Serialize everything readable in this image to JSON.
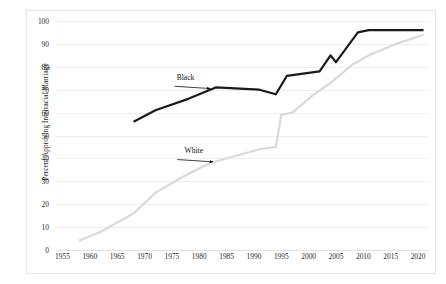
{
  "chart_data": {
    "type": "line",
    "title": "",
    "subtitle": "",
    "xlabel": "",
    "ylabel": "Percent Approving Interracial Marriage",
    "xlim": [
      1954,
      2022
    ],
    "ylim": [
      0,
      100
    ],
    "grid": true,
    "grid_axis": "y",
    "legend": "none",
    "x_ticks": [
      1955,
      1960,
      1965,
      1970,
      1975,
      1980,
      1985,
      1990,
      1995,
      2000,
      2005,
      2010,
      2015,
      2020
    ],
    "y_ticks": [
      0,
      10,
      20,
      30,
      40,
      50,
      60,
      70,
      80,
      90,
      100
    ],
    "series": [
      {
        "name": "Black",
        "color": "#1a1a1a",
        "width": 2.2,
        "points": [
          [
            1968,
            56
          ],
          [
            1972,
            61
          ],
          [
            1978,
            66
          ],
          [
            1983,
            71
          ],
          [
            1991,
            70
          ],
          [
            1994,
            68
          ],
          [
            1996,
            76
          ],
          [
            1999,
            77
          ],
          [
            2002,
            78
          ],
          [
            2004,
            85
          ],
          [
            2005,
            82
          ],
          [
            2009,
            95
          ],
          [
            2011,
            96
          ],
          [
            2021,
            96
          ]
        ]
      },
      {
        "name": "White",
        "color": "#d9d9d9",
        "width": 2.2,
        "points": [
          [
            1958,
            4
          ],
          [
            1962,
            8
          ],
          [
            1968,
            16
          ],
          [
            1972,
            25
          ],
          [
            1977,
            32
          ],
          [
            1982,
            38
          ],
          [
            1991,
            44
          ],
          [
            1994,
            45
          ],
          [
            1995,
            59
          ],
          [
            1997,
            60
          ],
          [
            2001,
            68
          ],
          [
            2004,
            73
          ],
          [
            2008,
            81
          ],
          [
            2011,
            85
          ],
          [
            2016,
            90
          ],
          [
            2021,
            94
          ]
        ]
      }
    ],
    "annotations": [
      {
        "name": "Black",
        "text": "Black",
        "label_x": 1977.5,
        "label_y": 75.5,
        "arrow_from_x": 1975.5,
        "arrow_from_y": 71.5,
        "arrow_to_x": 1982.0,
        "arrow_to_y": 70.5
      },
      {
        "name": "White",
        "text": "White",
        "label_x": 1979.0,
        "label_y": 43.5,
        "arrow_from_x": 1976.0,
        "arrow_from_y": 39.5,
        "arrow_to_x": 1982.5,
        "arrow_to_y": 38.5
      }
    ]
  }
}
